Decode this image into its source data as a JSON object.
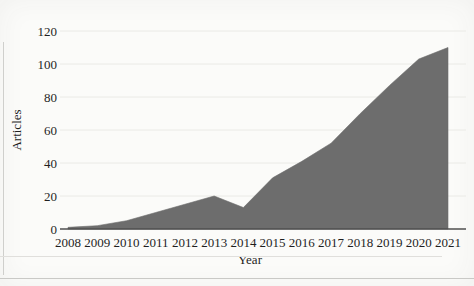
{
  "figure": {
    "kind": "scanned-area-chart-figure"
  },
  "chart_data": {
    "type": "area",
    "title": "",
    "xlabel": "Year",
    "ylabel": "Articles",
    "categories": [
      "2008",
      "2009",
      "2010",
      "2011",
      "2012",
      "2013",
      "2014",
      "2015",
      "2016",
      "2017",
      "2018",
      "2019",
      "2020",
      "2021"
    ],
    "values": [
      1,
      2,
      5,
      10,
      15,
      20,
      13,
      31,
      41,
      52,
      70,
      87,
      103,
      110
    ],
    "ylim": [
      0,
      120
    ],
    "yticks": [
      0,
      20,
      40,
      60,
      80,
      100,
      120
    ],
    "grid": "horizontal",
    "legend": "none",
    "area_color": "#6d6d6d",
    "axis_color": "#4f4f4f",
    "gridline_color": "#eaeae6",
    "text_color": "#1f1f1f"
  }
}
